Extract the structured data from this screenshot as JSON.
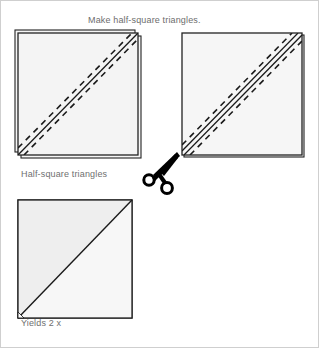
{
  "page": {
    "title": "Make half-square triangles.",
    "background_color": "#ffffff",
    "text_color": "#6f6f6f"
  },
  "labels": {
    "title": "Make half-square triangles.",
    "half_square_triangles": "Half-square triangles",
    "yields": "Yields 2 x"
  },
  "colors": {
    "fabric_fill": "#f2f2f2",
    "fabric_fill_light": "#f7f7f7",
    "fabric_fill_dark": "#e8e8e8",
    "outline": "#1a1a1a",
    "stitch_line": "#1a1a1a",
    "dashed_guide": "#1a1a1a",
    "page_border": "#c8c8c8",
    "scissors": "#000000"
  },
  "figures": [
    {
      "id": "figure-stacked-squares-left",
      "name": "stacked-fabric-squares-with-stitch-line",
      "x": 18,
      "y": 33,
      "width": 120,
      "height": 122,
      "offset_layer": 5,
      "solid_lines": 1,
      "dashed_lines": 2,
      "description": "Two fabric squares stacked right sides together with one drawn diagonal line and two dashed stitching guides"
    },
    {
      "id": "figure-stacked-squares-right",
      "name": "stacked-fabric-squares-with-cut-lines",
      "x": 182,
      "y": 33,
      "width": 120,
      "height": 122,
      "offset_layer": 0,
      "solid_lines": 2,
      "dashed_lines": 2,
      "description": "Stacked squares showing two sewn seam lines with dashed cutting guides"
    },
    {
      "id": "figure-half-square-triangle-unit",
      "name": "finished-half-square-triangle-unit",
      "x": 18,
      "y": 200,
      "width": 114,
      "height": 118,
      "solid_lines": 1,
      "dashed_lines": 0,
      "description": "Completed half-square triangle unit with one diagonal seam"
    }
  ],
  "icons": {
    "scissors": {
      "name": "scissors-icon",
      "x": 145,
      "y": 155,
      "width": 38,
      "height": 40,
      "meaning": "cut along the line"
    }
  }
}
